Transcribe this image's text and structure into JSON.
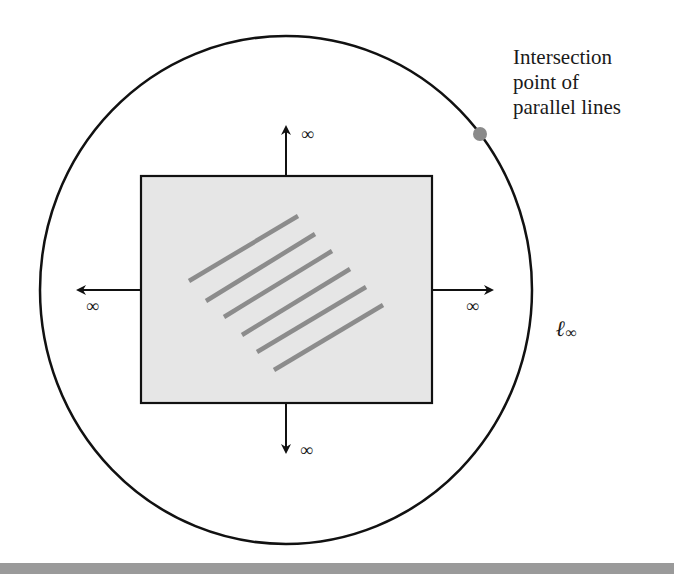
{
  "diagram": {
    "callout_lines": [
      "Intersection",
      "point of",
      "parallel lines"
    ],
    "infinity_symbol": "∞",
    "line_at_infinity_label": "ℓ",
    "line_at_infinity_subscript": "∞",
    "arrows": [
      {
        "direction": "up",
        "label": "∞"
      },
      {
        "direction": "down",
        "label": "∞"
      },
      {
        "direction": "left",
        "label": "∞"
      },
      {
        "direction": "right",
        "label": "∞"
      }
    ],
    "parallel_line_count": 6,
    "colors": {
      "plane_fill": "#e6e6e6",
      "parallel_lines": "#8c8c8c",
      "intersection_dot": "#8a8a8a",
      "outline": "#111111",
      "bottom_band": "#9a9a9a"
    }
  }
}
